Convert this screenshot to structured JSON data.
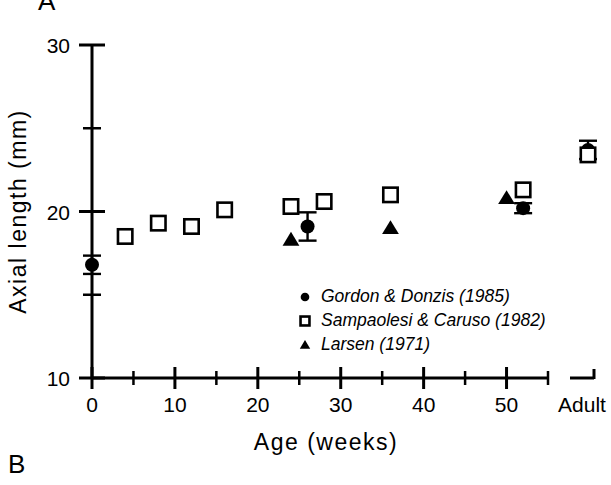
{
  "figure": {
    "panel_a_label": "A",
    "panel_b_label": "B"
  },
  "chart_data": {
    "type": "scatter",
    "title": "",
    "xlabel": "Age (weeks)",
    "ylabel": "Axial length (mm)",
    "xlim": [
      0,
      55
    ],
    "ylim": [
      10,
      30
    ],
    "xticks_major": [
      0,
      10,
      20,
      30,
      40,
      50
    ],
    "xticklabels_major": [
      "0",
      "10",
      "20",
      "30",
      "40",
      "50"
    ],
    "xticks_minor": [
      5,
      15,
      25,
      35,
      45,
      55
    ],
    "yticks_major": [
      10,
      20,
      30
    ],
    "yticklabels_major": [
      "10",
      "20",
      "30"
    ],
    "yticks_minor": [
      15,
      25
    ],
    "grid": false,
    "axis_break": true,
    "extra_category_label": "Adult",
    "legend_position": "center-right",
    "series": [
      {
        "name": "Gordon & Donzis (1985)",
        "marker": "filled-circle",
        "color": "#000000",
        "points": [
          {
            "x": 0,
            "y": 16.8,
            "yerr": 0.55,
            "label": "0"
          },
          {
            "x": 26,
            "y": 19.1,
            "yerr": 0.85,
            "label": "26"
          },
          {
            "x": 52,
            "y": 20.2,
            "yerr": 0.3,
            "label": "52"
          },
          {
            "x": "Adult",
            "y": 23.7,
            "yerr": 0.55,
            "label": "Adult"
          }
        ]
      },
      {
        "name": "Sampaolesi & Caruso (1982)",
        "marker": "open-square",
        "color": "#000000",
        "points": [
          {
            "x": 4,
            "y": 18.5,
            "label": "4"
          },
          {
            "x": 8,
            "y": 19.3,
            "label": "8"
          },
          {
            "x": 12,
            "y": 19.1,
            "label": "12"
          },
          {
            "x": 16,
            "y": 20.1,
            "label": "16"
          },
          {
            "x": 24,
            "y": 20.3,
            "label": "24"
          },
          {
            "x": 28,
            "y": 20.6,
            "label": "28"
          },
          {
            "x": 36,
            "y": 21.0,
            "label": "36"
          },
          {
            "x": 52,
            "y": 21.3,
            "label": "52"
          },
          {
            "x": "Adult",
            "y": 23.4,
            "label": "Adult"
          }
        ]
      },
      {
        "name": "Larsen (1971)",
        "marker": "filled-triangle",
        "color": "#000000",
        "points": [
          {
            "x": 24,
            "y": 18.3,
            "label": "24"
          },
          {
            "x": 36,
            "y": 19.0,
            "label": "36"
          },
          {
            "x": 50,
            "y": 20.8,
            "label": "50"
          }
        ]
      }
    ],
    "legend": [
      {
        "marker": "filled-circle",
        "label": "Gordon & Donzis (1985)"
      },
      {
        "marker": "open-square",
        "label": "Sampaolesi & Caruso (1982)"
      },
      {
        "marker": "filled-triangle",
        "label": "Larsen (1971)"
      }
    ]
  }
}
